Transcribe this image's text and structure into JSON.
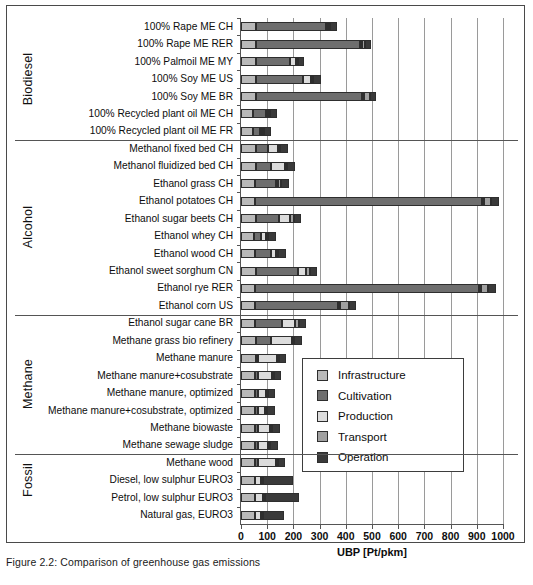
{
  "caption": "Figure 2.2: Comparison of greenhouse gas emissions",
  "chart_data": {
    "type": "bar",
    "orientation": "horizontal",
    "stacked": true,
    "title": "",
    "xlabel": "UBP [Pt/pkm]",
    "ylabel": "",
    "xlim": [
      0,
      1000
    ],
    "xticks": [
      0,
      100,
      200,
      300,
      400,
      500,
      600,
      700,
      800,
      900,
      1000
    ],
    "grid": true,
    "legend_position": "center-right",
    "series": [
      {
        "name": "Infrastructure",
        "color": "#b9b9b9"
      },
      {
        "name": "Cultivation",
        "color": "#6e6e6e"
      },
      {
        "name": "Production",
        "color": "#dcdcdc"
      },
      {
        "name": "Transport",
        "color": "#a0a0a0"
      },
      {
        "name": "Operation",
        "color": "#3a3a3a"
      }
    ],
    "groups": [
      {
        "name": "Biodiesel",
        "count": 7
      },
      {
        "name": "Alcohol",
        "count": 10
      },
      {
        "name": "Methane",
        "count": 8
      },
      {
        "name": "Fossil",
        "count": 3
      }
    ],
    "categories": [
      "100% Rape ME CH",
      "100% Rape ME RER",
      "100% Palmoil ME MY",
      "100% Soy ME US",
      "100% Soy ME BR",
      "100% Recycled plant oil ME CH",
      "100% Recycled plant oil ME FR",
      "Methanol fixed bed CH",
      "Methanol fluidized bed CH",
      "Ethanol grass CH",
      "Ethanol potatoes CH",
      "Ethanol sugar beets CH",
      "Ethanol whey CH",
      "Ethanol wood CH",
      "Ethanol sweet sorghum  CN",
      "Ethanol rye RER",
      "Ethanol corn US",
      "Ethanol sugar cane BR",
      "Methane grass bio refinery",
      "Methane manure",
      "Methane manure+cosubstrate",
      "Methane manure, optimized",
      "Methane manure+cosubstrate, optimized",
      "Methane biowaste",
      "Methane sewage sludge",
      "Methane wood",
      "Diesel, low sulphur EURO3",
      "Petrol, low sulphur EURO3",
      "Natural gas, EURO3"
    ],
    "values": [
      [
        58,
        267,
        6,
        4,
        25
      ],
      [
        56,
        397,
        5,
        12,
        25
      ],
      [
        56,
        130,
        25,
        5,
        23
      ],
      [
        57,
        179,
        33,
        5,
        28
      ],
      [
        57,
        403,
        6,
        23,
        25
      ],
      [
        47,
        47,
        4,
        6,
        29
      ],
      [
        44,
        30,
        4,
        5,
        27
      ],
      [
        56,
        47,
        38,
        4,
        30
      ],
      [
        56,
        58,
        54,
        4,
        31
      ],
      [
        55,
        79,
        5,
        12,
        29
      ],
      [
        54,
        866,
        6,
        26,
        30
      ],
      [
        56,
        89,
        43,
        14,
        28
      ],
      [
        48,
        28,
        20,
        4,
        30
      ],
      [
        55,
        59,
        20,
        5,
        29
      ],
      [
        56,
        161,
        33,
        12,
        29
      ],
      [
        54,
        855,
        6,
        25,
        30
      ],
      [
        55,
        316,
        6,
        32,
        28
      ],
      [
        55,
        103,
        50,
        13,
        28
      ],
      [
        59,
        56,
        81,
        5,
        28
      ],
      [
        56,
        10,
        71,
        5,
        29
      ],
      [
        55,
        10,
        52,
        5,
        30
      ],
      [
        55,
        9,
        30,
        5,
        30
      ],
      [
        55,
        9,
        29,
        5,
        30
      ],
      [
        55,
        9,
        48,
        5,
        30
      ],
      [
        55,
        9,
        41,
        5,
        30
      ],
      [
        55,
        9,
        68,
        5,
        30
      ],
      [
        54,
        0,
        23,
        5,
        115
      ],
      [
        54,
        0,
        31,
        5,
        130
      ],
      [
        54,
        0,
        22,
        5,
        82
      ]
    ]
  },
  "legend": {
    "items": [
      {
        "label": "Infrastructure",
        "swatch_class": "s-infra"
      },
      {
        "label": "Cultivation",
        "swatch_class": "s-cult"
      },
      {
        "label": "Production",
        "swatch_class": "s-prod"
      },
      {
        "label": "Transport",
        "swatch_class": "s-trans"
      },
      {
        "label": "Operation",
        "swatch_class": "s-oper"
      }
    ]
  }
}
